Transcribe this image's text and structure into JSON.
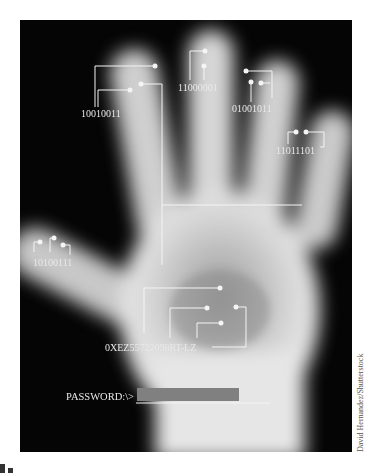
{
  "image": {
    "description": "X-ray style hand with biometric binary-code annotations",
    "labels": {
      "index": "10010011",
      "middle": "11000001",
      "ring": "01001011",
      "pinky": "11011101",
      "thumb": "10100111",
      "palm": "0XEZ55722098RT-LZ"
    },
    "password_prompt": "PASSWORD:\\>",
    "credit": "David Hernandez/Shutterstock"
  }
}
